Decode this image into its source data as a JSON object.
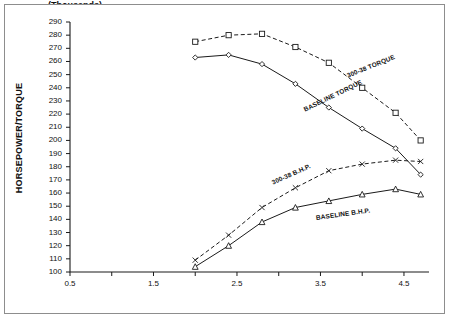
{
  "chart_data": {
    "type": "line",
    "title": "",
    "xlabel": "(Thousands) RPM",
    "xlabel_line1": "(Thousands)",
    "xlabel_line2": "RPM",
    "ylabel": "HORSEPOWER/TORQUE",
    "xlim": [
      0.5,
      4.8
    ],
    "ylim": [
      100,
      290
    ],
    "ytick_step": 10,
    "xtick_step": 0.5,
    "grid": false,
    "legend_position": "inline-annotations",
    "yticks": [
      100,
      110,
      120,
      130,
      140,
      150,
      160,
      170,
      180,
      190,
      200,
      210,
      220,
      230,
      240,
      250,
      260,
      270,
      280,
      290
    ],
    "xticks": [
      0.5,
      1.0,
      1.5,
      2.0,
      2.5,
      3.0,
      3.5,
      4.0,
      4.5
    ],
    "xtick_labels": [
      "0.5",
      "",
      "1.5",
      "",
      "2.5",
      "",
      "3.5",
      "",
      "4.5"
    ],
    "x": [
      2.0,
      2.4,
      2.8,
      3.2,
      3.6,
      4.0,
      4.4,
      4.7
    ],
    "series": [
      {
        "name": "300-38 TORQUE",
        "style": "dashed",
        "marker": "square",
        "values": [
          275,
          280,
          281,
          271,
          259,
          240,
          221,
          200
        ]
      },
      {
        "name": "BASELINE TORQUE",
        "style": "solid",
        "marker": "diamond",
        "values": [
          263,
          265,
          258,
          243,
          225,
          209,
          194,
          174
        ]
      },
      {
        "name": "300-38 B.H.P.",
        "style": "dashed",
        "marker": "cross",
        "values": [
          109,
          128,
          149,
          164,
          177,
          182,
          185,
          184
        ]
      },
      {
        "name": "BASELINE B.H.P.",
        "style": "solid",
        "marker": "triangle",
        "values": [
          104,
          120,
          138,
          149,
          154,
          159,
          163,
          159
        ]
      }
    ],
    "annotations": [
      {
        "text": "300-38 TORQUE",
        "x": 3.82,
        "y": 252,
        "rotation": -22
      },
      {
        "text": "BASELINE TORQUE",
        "x": 3.3,
        "y": 226,
        "rotation": -26
      },
      {
        "text": "300-38 B.H.P.",
        "x": 2.92,
        "y": 171,
        "rotation": -24
      },
      {
        "text": "BASELINE B.H.P.",
        "x": 3.45,
        "y": 144,
        "rotation": -8
      }
    ],
    "colors": {
      "line": "#1a1a1a",
      "axis": "#1a1a1a",
      "frame": "#8d8d8d",
      "background": "#ffffff"
    }
  }
}
